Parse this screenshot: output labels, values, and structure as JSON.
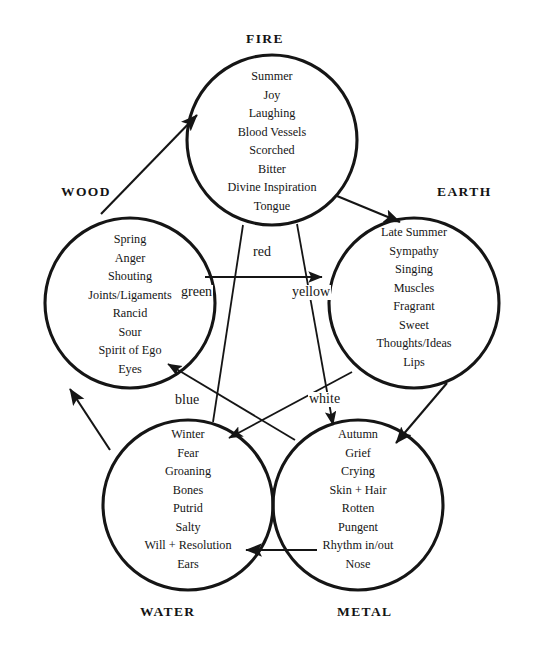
{
  "diagram": {
    "background_color": "#ffffff",
    "stroke_color": "#151515"
  },
  "elements": [
    {
      "key": "fire",
      "label": "FIRE",
      "label_position": "top",
      "attributes": [
        "Summer",
        "Joy",
        "Laughing",
        "Blood Vessels",
        "Scorched",
        "Bitter",
        "Divine Inspiration",
        "Tongue"
      ]
    },
    {
      "key": "wood",
      "label": "WOOD",
      "label_position": "upper-left",
      "attributes": [
        "Spring",
        "Anger",
        "Shouting",
        "Joints/Ligaments",
        "Rancid",
        "Sour",
        "Spirit of Ego",
        "Eyes"
      ]
    },
    {
      "key": "earth",
      "label": "EARTH",
      "label_position": "upper-right",
      "attributes": [
        "Late Summer",
        "Sympathy",
        "Singing",
        "Muscles",
        "Fragrant",
        "Sweet",
        "Thoughts/Ideas",
        "Lips"
      ]
    },
    {
      "key": "water",
      "label": "WATER",
      "label_position": "bottom-left",
      "attributes": [
        "Winter",
        "Fear",
        "Groaning",
        "Bones",
        "Putrid",
        "Salty",
        "Will + Resolution",
        "Ears"
      ]
    },
    {
      "key": "metal",
      "label": "METAL",
      "label_position": "bottom-right",
      "attributes": [
        "Autumn",
        "Grief",
        "Crying",
        "Skin + Hair",
        "Rotten",
        "Pungent",
        "Rhythm in/out",
        "Nose"
      ]
    }
  ],
  "color_labels": [
    {
      "key": "red",
      "label": "red",
      "element": "fire"
    },
    {
      "key": "green",
      "label": "green",
      "element": "wood"
    },
    {
      "key": "yellow",
      "label": "yellow",
      "element": "earth"
    },
    {
      "key": "blue",
      "label": "blue",
      "element": "water"
    },
    {
      "key": "white",
      "label": "white",
      "element": "metal"
    }
  ],
  "generating_cycle": [
    {
      "from": "wood",
      "to": "fire"
    },
    {
      "from": "fire",
      "to": "earth"
    },
    {
      "from": "earth",
      "to": "metal"
    },
    {
      "from": "metal",
      "to": "water"
    },
    {
      "from": "water",
      "to": "wood"
    }
  ],
  "controlling_cycle": [
    {
      "from": "wood",
      "to": "earth"
    },
    {
      "from": "earth",
      "to": "water"
    },
    {
      "from": "water",
      "to": "fire"
    },
    {
      "from": "fire",
      "to": "metal"
    },
    {
      "from": "metal",
      "to": "wood"
    }
  ]
}
